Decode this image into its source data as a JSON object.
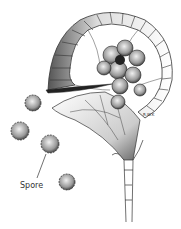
{
  "figure": {
    "labels": [
      {
        "id": "spore",
        "text": "Spore"
      }
    ],
    "signature": "R.W.K",
    "colors": {
      "ink": "#222222",
      "shade": "#888888",
      "background": "#ffffff"
    }
  }
}
